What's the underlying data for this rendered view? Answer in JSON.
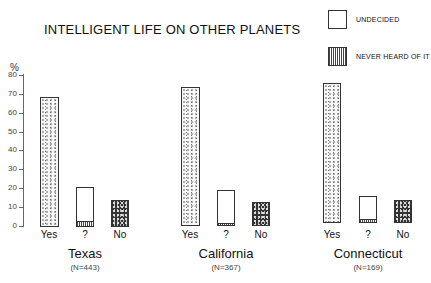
{
  "title": "INTELLIGENT LIFE ON OTHER PLANETS",
  "legend": [
    {
      "label": "UNDECIDED",
      "pattern": "white"
    },
    {
      "label": "NEVER HEARD OF IT",
      "pattern": "vertical-hatch"
    }
  ],
  "axis": {
    "unit": "%",
    "ticks": [
      "0",
      "10",
      "20",
      "30",
      "40",
      "50",
      "60",
      "70",
      "80"
    ]
  },
  "groups": [
    {
      "name": "Texas",
      "n": "(N=443)",
      "labels": [
        "Yes",
        "?",
        "No"
      ]
    },
    {
      "name": "California",
      "n": "(N=367)",
      "labels": [
        "Yes",
        "?",
        "No"
      ]
    },
    {
      "name": "Connecticut",
      "n": "(N=169)",
      "labels": [
        "Yes",
        "?",
        "No"
      ]
    }
  ],
  "chart_data": {
    "type": "bar",
    "title": "INTELLIGENT LIFE ON OTHER PLANETS",
    "ylabel": "%",
    "ylim": [
      0,
      80
    ],
    "grid": false,
    "legend_position": "top-right",
    "categories": [
      "Texas (N=443)",
      "California (N=367)",
      "Connecticut (N=169)"
    ],
    "series": [
      {
        "name": "Yes",
        "values": [
          68,
          73,
          75
        ]
      },
      {
        "name": "? (Undecided)",
        "values": [
          18,
          18,
          13
        ]
      },
      {
        "name": "? (Never heard of it)",
        "values": [
          3,
          1,
          2
        ]
      },
      {
        "name": "No",
        "values": [
          14,
          13,
          13
        ]
      }
    ]
  }
}
